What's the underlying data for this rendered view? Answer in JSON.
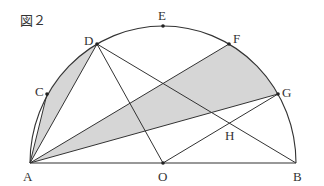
{
  "figure": {
    "title": "図２",
    "shade_color": "#d6d6d6",
    "line_color": "#333333",
    "center": {
      "x": 163,
      "y": 163
    },
    "radius_x": 133,
    "radius_y": 137,
    "points": {
      "A": {
        "label": "A",
        "x": 30,
        "y": 163
      },
      "B": {
        "label": "B",
        "x": 296,
        "y": 163
      },
      "O": {
        "label": "O",
        "x": 163,
        "y": 163
      },
      "C": {
        "label": "C",
        "x": 47,
        "y": 94
      },
      "D": {
        "label": "D",
        "x": 97,
        "y": 44
      },
      "E": {
        "label": "E",
        "x": 163,
        "y": 26
      },
      "F": {
        "label": "F",
        "x": 229,
        "y": 44
      },
      "G": {
        "label": "G",
        "x": 278,
        "y": 94
      },
      "H": {
        "label": "H",
        "x": 229,
        "y": 123
      }
    },
    "segments": [
      [
        "A",
        "B"
      ],
      [
        "A",
        "C"
      ],
      [
        "A",
        "D"
      ],
      [
        "A",
        "F"
      ],
      [
        "A",
        "G"
      ],
      [
        "D",
        "O"
      ],
      [
        "D",
        "B"
      ],
      [
        "O",
        "G"
      ]
    ],
    "shaded_regions": [
      {
        "name": "region-ACD",
        "boundary": "chord AC, arc CD, chord DA"
      },
      {
        "name": "region-AFG",
        "boundary": "chord AF, arc FG, chord GA"
      }
    ]
  }
}
